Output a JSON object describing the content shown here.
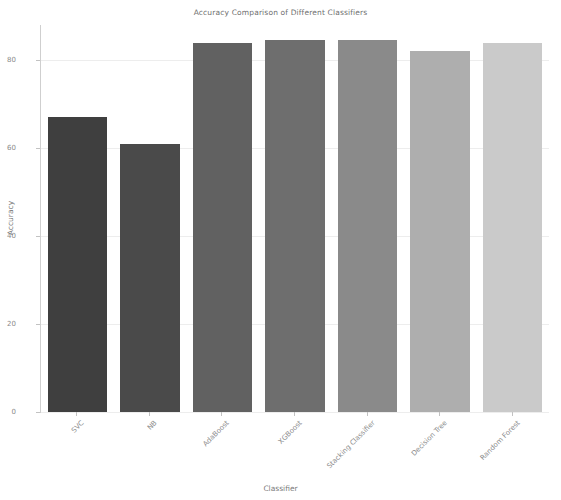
{
  "chart_data": {
    "type": "bar",
    "title": "Accuracy Comparison of Different Classifiers",
    "xlabel": "Classifier",
    "ylabel": "Accuracy",
    "categories": [
      "SVC",
      "NB",
      "AdaBoost",
      "XGBoost",
      "Stacking Classifier",
      "Decision Tree",
      "Random Forest"
    ],
    "values": [
      67.0,
      61.0,
      84.0,
      84.5,
      84.5,
      82.0,
      84.0
    ],
    "bar_colors": [
      "#3f3f3f",
      "#4a4a4a",
      "#616161",
      "#6e6e6e",
      "#8a8a8a",
      "#aeaeae",
      "#cacaca"
    ],
    "ylim": [
      0,
      88
    ],
    "yticks": [
      0,
      20,
      40,
      60,
      80
    ],
    "ytick_labels": [
      "0",
      "20",
      "40",
      "60",
      "80"
    ],
    "grid": true,
    "grid_axis": "y",
    "legend": false,
    "xtick_rotation": -45
  }
}
